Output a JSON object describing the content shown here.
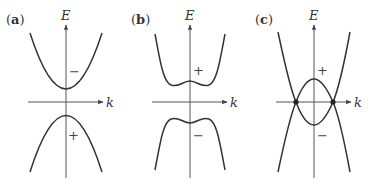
{
  "figure": {
    "panels": [
      {
        "id": "a",
        "label": "(a)",
        "label_bold": "a",
        "y_axis": "E",
        "x_axis": "k",
        "upper_band_sign": "−",
        "lower_band_sign": "+",
        "description": "Gapped parabolic bands, upper band minimum and lower band maximum at k=0"
      },
      {
        "id": "b",
        "label": "(b)",
        "label_bold": "b",
        "y_axis": "E",
        "x_axis": "k",
        "upper_band_sign": "+",
        "lower_band_sign": "−",
        "description": "Gapped bands with Mexican-hat shape (band inversion), local extremum at k=0"
      },
      {
        "id": "c",
        "label": "(c)",
        "label_bold": "c",
        "y_axis": "E",
        "x_axis": "k",
        "upper_band_sign": "+",
        "lower_band_sign": "−",
        "description": "Inverted bands crossing at two points on the k axis (marked with dots)"
      }
    ]
  }
}
